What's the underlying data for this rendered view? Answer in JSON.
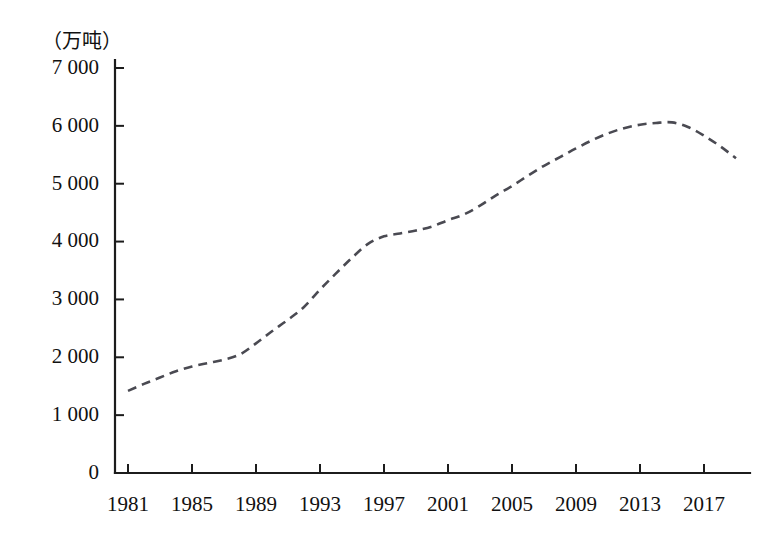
{
  "chart_data": {
    "type": "line",
    "title": "",
    "subtitle": "",
    "xlabel": "",
    "ylabel": "",
    "unit_label": "（万吨）",
    "grid": false,
    "legend": "none",
    "line_style": "dashed",
    "line_color": "#4a4a52",
    "axis_color": "#1c1c1c",
    "xlim": [
      1981,
      2019
    ],
    "ylim": [
      0,
      7000
    ],
    "ytick_labels": [
      "0",
      "1 000",
      "2 000",
      "3 000",
      "4 000",
      "5 000",
      "6 000",
      "7 000"
    ],
    "ytick_values": [
      0,
      1000,
      2000,
      3000,
      4000,
      5000,
      6000,
      7000
    ],
    "xtick_labels": [
      "1981",
      "1985",
      "1989",
      "1993",
      "1997",
      "2001",
      "2005",
      "2009",
      "2013",
      "2017"
    ],
    "xtick_values": [
      1981,
      1985,
      1989,
      1993,
      1997,
      2001,
      2005,
      2009,
      2013,
      2017
    ],
    "x": [
      1981,
      1982,
      1983,
      1984,
      1985,
      1986,
      1987,
      1988,
      1989,
      1990,
      1991,
      1992,
      1993,
      1994,
      1995,
      1996,
      1997,
      1998,
      1999,
      2000,
      2001,
      2002,
      2003,
      2004,
      2005,
      2006,
      2007,
      2008,
      2009,
      2010,
      2011,
      2012,
      2013,
      2014,
      2015,
      2016,
      2017,
      2018,
      2019
    ],
    "values": [
      1420,
      1540,
      1650,
      1760,
      1840,
      1900,
      1960,
      2050,
      2240,
      2450,
      2650,
      2870,
      3170,
      3450,
      3720,
      3960,
      4090,
      4140,
      4190,
      4260,
      4370,
      4470,
      4620,
      4800,
      4960,
      5140,
      5310,
      5460,
      5610,
      5750,
      5870,
      5960,
      6020,
      6050,
      6060,
      5980,
      5830,
      5650,
      5440
    ],
    "series_name": "年产量"
  }
}
